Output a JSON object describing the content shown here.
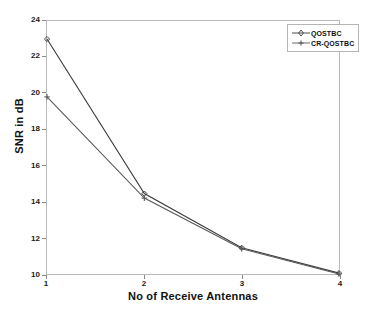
{
  "chart_data": {
    "type": "line",
    "title": "",
    "xlabel": "No of Receive Antennas",
    "ylabel": "SNR in dB",
    "x": [
      1,
      2,
      3,
      4
    ],
    "xticklabels": [
      "1",
      "2",
      "3",
      "4"
    ],
    "yticklabels": [
      "10",
      "12",
      "14",
      "16",
      "18",
      "20",
      "22",
      "24"
    ],
    "xlim": [
      1,
      4
    ],
    "ylim": [
      10,
      24
    ],
    "ytick_step": 2,
    "grid": false,
    "legend_position": "top-right",
    "series": [
      {
        "name": "QOSTBC",
        "marker": "diamond",
        "color": "#3a3a3a",
        "values": [
          23.0,
          14.45,
          11.45,
          10.05
        ]
      },
      {
        "name": "CR-QOSTBC",
        "marker": "plus",
        "color": "#5a5a5a",
        "values": [
          19.8,
          14.2,
          11.4,
          10.0
        ]
      }
    ]
  },
  "legend": {
    "entries": [
      "QOSTBC",
      "CR-QOSTBC"
    ]
  },
  "colors": {
    "series1": "#3a3a3a",
    "series2": "#5a5a5a",
    "axis": "#b9b9b9",
    "text": "#121212",
    "background": "#ffffff"
  }
}
